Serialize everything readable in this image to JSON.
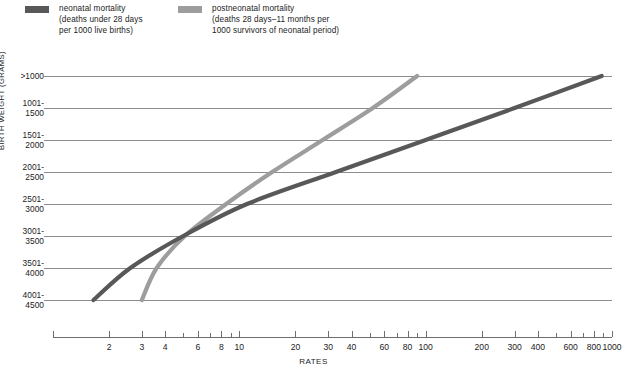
{
  "legend": {
    "items": [
      {
        "name": "neonatal",
        "color": "#585858",
        "line1": "neonatal mortality",
        "line2": "(deaths under 28 days",
        "line3": "per 1000 live births)"
      },
      {
        "name": "postneonatal",
        "color": "#9d9d9d",
        "line1": "postneonatal mortality",
        "line2": "(deaths 28 days–11 months per",
        "line3": "1000 survivors of neonatal period)"
      }
    ]
  },
  "axes": {
    "y_title": "BIRTH WEIGHT (GRAMS)",
    "x_title": "RATES",
    "y_categories": [
      {
        "l1": ">1000",
        "l2": ""
      },
      {
        "l1": "1001-",
        "l2": "1500"
      },
      {
        "l1": "1501-",
        "l2": "2000"
      },
      {
        "l1": "2001-",
        "l2": "2500"
      },
      {
        "l1": "2501-",
        "l2": "3000"
      },
      {
        "l1": "3001-",
        "l2": "3500"
      },
      {
        "l1": "3501-",
        "l2": "4000"
      },
      {
        "l1": "4001-",
        "l2": "4500"
      }
    ],
    "x_tick_labels": [
      "2",
      "3",
      "4",
      "6",
      "8",
      "10",
      "20",
      "30",
      "40",
      "60",
      "80",
      "100",
      "200",
      "300",
      "400",
      "600",
      "800",
      "1000"
    ],
    "x_minor_ticks": [
      5,
      7,
      9,
      50,
      70,
      90,
      500,
      700,
      900
    ],
    "x_range": [
      1,
      1000
    ],
    "x_scale": "log"
  },
  "chart_data": {
    "type": "line",
    "title": "",
    "xlabel": "RATES",
    "ylabel": "BIRTH WEIGHT (GRAMS)",
    "xscale": "log",
    "xlim": [
      1,
      1000
    ],
    "grid": true,
    "legend_position": "top",
    "categories": [
      ">1000",
      "1001-1500",
      "1501-2000",
      "2001-2500",
      "2501-3000",
      "3001-3500",
      "3501-4000",
      "4001-4500"
    ],
    "series": [
      {
        "name": "neonatal mortality",
        "color": "#585858",
        "units": "deaths under 28 days per 1000 live births",
        "values": [
          880,
          300,
          100,
          33,
          11,
          5.0,
          2.6,
          1.65
        ]
      },
      {
        "name": "postneonatal mortality",
        "color": "#9d9d9d",
        "units": "deaths 28 days–11 months per 1000 survivors of neonatal period",
        "values": [
          90,
          52,
          28,
          15,
          8.5,
          5.1,
          3.6,
          3.0
        ]
      }
    ],
    "annotations": [
      {
        "text": "curves cross near rate 5 at 2501-3000 g",
        "x": 5.3,
        "category": "2501-3000"
      }
    ]
  },
  "style": {
    "gridline_color": "#8d8d8d",
    "axis_color": "#6e6e6e",
    "background": "#ffffff",
    "text_color": "#1c1c1c"
  }
}
